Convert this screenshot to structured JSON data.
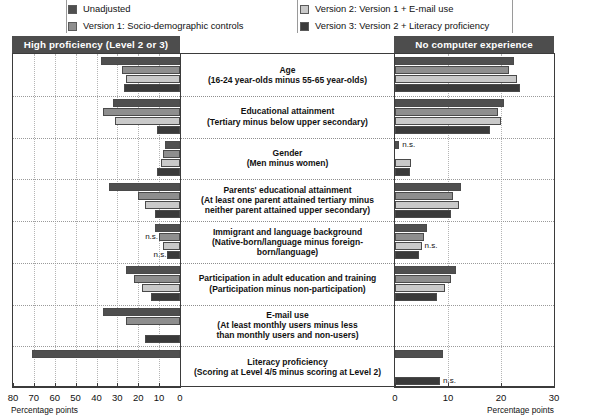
{
  "legend": {
    "items": [
      {
        "label": "Unadjusted",
        "color": "#4f4f4f",
        "column": 1
      },
      {
        "label": "Version 1: Socio-demographic controls",
        "color": "#8e8e8e",
        "column": 1
      },
      {
        "label": "Version 2: Version 1 + E-mail use",
        "color": "#c9c9c9",
        "column": 2
      },
      {
        "label": "Version 3: Version 2 + Literacy proficiency",
        "color": "#3a3a3a",
        "column": 2
      }
    ]
  },
  "panels": {
    "left": {
      "title": "High proficiency (Level 2 or 3)"
    },
    "right": {
      "title": "No computer experience"
    }
  },
  "axes": {
    "left": {
      "ticks": [
        80,
        70,
        60,
        50,
        40,
        30,
        20,
        10,
        0
      ],
      "title": "Percentage points",
      "min": 0,
      "max": 80,
      "reversed": true
    },
    "right": {
      "ticks": [
        0,
        10,
        20,
        30
      ],
      "title": "Percentage points",
      "min": 0,
      "max": 30,
      "reversed": false
    }
  },
  "categories": [
    {
      "line1": "Age",
      "line2": "(16-24 year-olds minus 55-65 year-olds)",
      "line3": ""
    },
    {
      "line1": "Educational attainment",
      "line2": "(Tertiary minus below upper secondary)",
      "line3": ""
    },
    {
      "line1": "Gender",
      "line2": "(Men minus women)",
      "line3": ""
    },
    {
      "line1": "Parents' educational attainment",
      "line2": "(At least one parent attained tertiary minus",
      "line3": "neither parent attained upper secondary)"
    },
    {
      "line1": "Immigrant and language background",
      "line2": "(Native-born/language minus foreign-born/language)",
      "line3": ""
    },
    {
      "line1": "Participation in adult education and training",
      "line2": "(Participation minus non-participation)",
      "line3": ""
    },
    {
      "line1": "E-mail use",
      "line2": "(At least monthly users minus less",
      "line3": "than monthly users and non-users)"
    },
    {
      "line1": "Literacy proficiency",
      "line2": "(Scoring at Level 4/5 minus scoring at Level 2)",
      "line3": ""
    }
  ],
  "chart_data": {
    "type": "bar",
    "title": "",
    "orientation": "horizontal",
    "panels": [
      {
        "name": "High proficiency (Level 2 or 3)",
        "xlabel": "Percentage points",
        "xlim": [
          0,
          80
        ],
        "reversed": true,
        "grid": true,
        "categories": [
          "Age (16-24 year-olds minus 55-65 year-olds)",
          "Educational attainment (Tertiary minus below upper secondary)",
          "Gender (Men minus women)",
          "Parents' educational attainment (At least one parent attained tertiary minus neither parent attained upper secondary)",
          "Immigrant and language background (Native-born/language minus foreign-born/language)",
          "Participation in adult education and training (Participation minus non-participation)",
          "E-mail use (At least monthly users minus less than monthly users and non-users)",
          "Literacy proficiency (Scoring at Level 4/5 minus scoring at Level 2)"
        ],
        "series": [
          {
            "name": "Unadjusted",
            "color": "#4f4f4f",
            "values": [
              38,
              32,
              7,
              34,
              12,
              26,
              37,
              71
            ]
          },
          {
            "name": "Version 1: Socio-demographic controls",
            "color": "#8e8e8e",
            "values": [
              28,
              37,
              8,
              20,
              10,
              22,
              26,
              0
            ]
          },
          {
            "name": "Version 2: Version 1 + E-mail use",
            "color": "#c9c9c9",
            "values": [
              26,
              31,
              9,
              17,
              8,
              18,
              0,
              0
            ]
          },
          {
            "name": "Version 3: Version 2 + Literacy proficiency",
            "color": "#3a3a3a",
            "values": [
              27,
              11,
              11,
              12,
              6,
              14,
              17,
              0
            ]
          }
        ],
        "annotations": [
          {
            "category_index": 4,
            "series_index": 1,
            "text": "n.s."
          },
          {
            "category_index": 4,
            "series_index": 3,
            "text": "n.s."
          }
        ]
      },
      {
        "name": "No computer experience",
        "xlabel": "Percentage points",
        "xlim": [
          0,
          30
        ],
        "reversed": false,
        "grid": true,
        "categories": [
          "Age (16-24 year-olds minus 55-65 year-olds)",
          "Educational attainment (Tertiary minus below upper secondary)",
          "Gender (Men minus women)",
          "Parents' educational attainment (At least one parent attained tertiary minus neither parent attained upper secondary)",
          "Immigrant and language background (Native-born/language minus foreign-born/language)",
          "Participation in adult education and training (Participation minus non-participation)",
          "E-mail use (At least monthly users minus less than monthly users and non-users)",
          "Literacy proficiency (Scoring at Level 4/5 minus scoring at Level 2)"
        ],
        "series": [
          {
            "name": "Unadjusted",
            "color": "#4f4f4f",
            "values": [
              22.5,
              20.5,
              0.8,
              12.5,
              6.0,
              11.5,
              0,
              9.0
            ]
          },
          {
            "name": "Version 1: Socio-demographic controls",
            "color": "#8e8e8e",
            "values": [
              21.5,
              19.5,
              0,
              11.0,
              5.5,
              10.5,
              0,
              0
            ]
          },
          {
            "name": "Version 2: Version 1 + E-mail use",
            "color": "#c9c9c9",
            "values": [
              23.0,
              20.0,
              3.0,
              12.0,
              5.0,
              9.5,
              0,
              0
            ]
          },
          {
            "name": "Version 3: Version 2 + Literacy proficiency",
            "color": "#3a3a3a",
            "values": [
              23.5,
              18.0,
              2.8,
              10.5,
              4.5,
              8.0,
              0,
              8.5
            ]
          }
        ],
        "annotations": [
          {
            "category_index": 2,
            "series_index": 0,
            "text": "n.s."
          },
          {
            "category_index": 4,
            "series_index": 2,
            "text": "n.s."
          },
          {
            "category_index": 7,
            "series_index": 3,
            "text": "n.s."
          }
        ]
      }
    ]
  }
}
